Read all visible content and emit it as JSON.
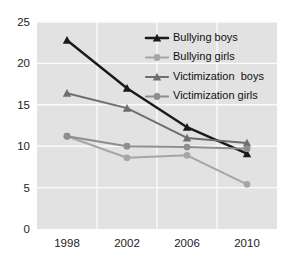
{
  "chart_data": {
    "type": "line",
    "title": "",
    "xlabel": "",
    "ylabel": "",
    "categories": [
      "1998",
      "2002",
      "2006",
      "2010"
    ],
    "x_tick_labels": [
      "1998",
      "2002",
      "2006",
      "2010"
    ],
    "y_tick_labels": [
      "0",
      "5",
      "10",
      "15",
      "20",
      "25"
    ],
    "y_ticks": [
      0,
      5,
      10,
      15,
      20,
      25
    ],
    "ylim": [
      0,
      25
    ],
    "grid": "horizontal-and-vertical-white",
    "legend_position": "top-right",
    "series": [
      {
        "name": "Bullying boys",
        "color": "#1a1a1a",
        "marker": "triangle",
        "values": [
          22.8,
          17.0,
          12.3,
          9.1
        ]
      },
      {
        "name": "Bullying girls",
        "color": "#a6a6a6",
        "marker": "circle",
        "values": [
          11.2,
          8.6,
          8.9,
          5.4
        ]
      },
      {
        "name": "Victimization  boys",
        "color": "#6e6e6e",
        "marker": "triangle",
        "values": [
          16.4,
          14.6,
          11.0,
          10.4
        ]
      },
      {
        "name": "Victimization girls",
        "color": "#8e8e8e",
        "marker": "circle",
        "values": [
          11.2,
          10.0,
          9.9,
          9.7
        ]
      }
    ]
  },
  "colors": {
    "plot_background": "#e2e2e2",
    "gridline": "#fbfbfb",
    "page_background": "#ffffff",
    "tick_text": "#222222"
  }
}
